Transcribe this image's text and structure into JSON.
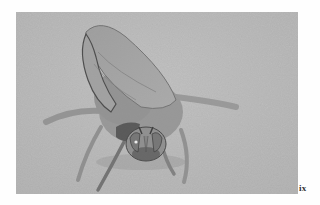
{
  "page": {
    "number": "ix",
    "background": "#fefefe"
  },
  "photo": {
    "subject": "fly-insect-on-sand",
    "description": "Grayscale close-up photograph of a large fly with folded wings standing on a sandy surface, head facing the viewer",
    "colors": {
      "ground": "#b8b8b8",
      "ground_light": "#c9c9c9",
      "body": "#8e8e8e",
      "wing": "#a2a2a2",
      "dark": "#3c3c3c",
      "eye_highlight": "#f2f2f2"
    }
  }
}
